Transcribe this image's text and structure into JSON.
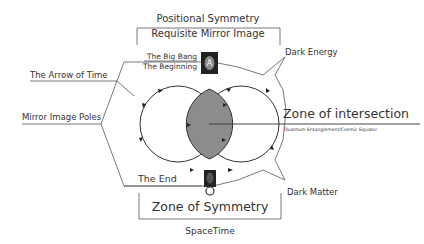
{
  "diagram": {
    "top": {
      "title": "Positional Symmetry",
      "subtitle": "Requisite Mirror Image"
    },
    "left_labels": {
      "arrow_of_time": "The Arrow of Time",
      "mirror_poles": "Mirror Image Poles",
      "big_bang": "The Big Bang",
      "beginning": "The Beginning",
      "end": "The End"
    },
    "right_labels": {
      "dark_energy": "Dark Energy",
      "zone_intersection": "Zone of intersection",
      "zone_intersection_sub": "Quantum Entanglement/Cosmic Equator",
      "dark_matter": "Dark Matter"
    },
    "bottom": {
      "title": "Zone of Symmetry",
      "subtitle": "SpaceTime"
    },
    "icons": {
      "top_pole": "alpha-card-icon",
      "bottom_pole": "omega-card-icon"
    },
    "colors": {
      "intersection_fill": "#8c8c8c",
      "line": "#333333",
      "card": "#222222"
    }
  }
}
